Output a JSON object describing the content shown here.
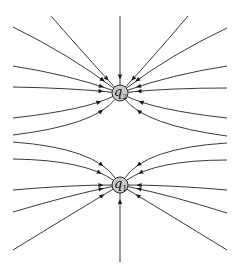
{
  "diagram": {
    "line_color": "#3a3a3a",
    "charge_fill": "#c8c8c8",
    "charges": [
      {
        "id": "q2",
        "symbol": "q",
        "subscript": "2",
        "cx": 120,
        "cy": 93,
        "r": 8
      },
      {
        "id": "q1",
        "symbol": "q",
        "subscript": "1",
        "cx": 120,
        "cy": 185,
        "r": 8
      }
    ],
    "field_direction": "inward",
    "lines_q2": [
      {
        "from": [
          120,
          16
        ],
        "ctrl": [
          120,
          50
        ],
        "arrow_t": 0.92
      },
      {
        "from": [
          51,
          16
        ],
        "ctrl": [
          85,
          55
        ],
        "arrow_t": 0.9
      },
      {
        "from": [
          188,
          16
        ],
        "ctrl": [
          155,
          55
        ],
        "arrow_t": 0.9
      },
      {
        "from": [
          13,
          27
        ],
        "ctrl": [
          70,
          55
        ],
        "arrow_t": 0.9
      },
      {
        "from": [
          227,
          28
        ],
        "ctrl": [
          170,
          55
        ],
        "arrow_t": 0.9
      },
      {
        "from": [
          13,
          66
        ],
        "ctrl": [
          70,
          75
        ],
        "arrow_t": 0.9
      },
      {
        "from": [
          227,
          66
        ],
        "ctrl": [
          170,
          75
        ],
        "arrow_t": 0.9
      },
      {
        "from": [
          13,
          87
        ],
        "ctrl": [
          70,
          88
        ],
        "arrow_t": 0.9
      },
      {
        "from": [
          227,
          88
        ],
        "ctrl": [
          170,
          88
        ],
        "arrow_t": 0.9
      },
      {
        "from": [
          13,
          118
        ],
        "ctrl": [
          85,
          110
        ],
        "arrow_t": 0.82
      },
      {
        "from": [
          227,
          118
        ],
        "ctrl": [
          155,
          110
        ],
        "arrow_t": 0.82
      },
      {
        "from": [
          13,
          135
        ],
        "ctrl": [
          95,
          125
        ],
        "arrow_t": 0.78
      },
      {
        "from": [
          227,
          136
        ],
        "ctrl": [
          145,
          125
        ],
        "arrow_t": 0.78
      }
    ],
    "lines_q1": [
      {
        "from": [
          120,
          262
        ],
        "ctrl": [
          120,
          230
        ],
        "arrow_t": 0.92
      },
      {
        "from": [
          13,
          250
        ],
        "ctrl": [
          70,
          215
        ],
        "arrow_t": 0.9
      },
      {
        "from": [
          227,
          250
        ],
        "ctrl": [
          170,
          215
        ],
        "arrow_t": 0.9
      },
      {
        "from": [
          13,
          212
        ],
        "ctrl": [
          70,
          195
        ],
        "arrow_t": 0.9
      },
      {
        "from": [
          227,
          213
        ],
        "ctrl": [
          170,
          195
        ],
        "arrow_t": 0.9
      },
      {
        "from": [
          13,
          190
        ],
        "ctrl": [
          70,
          185
        ],
        "arrow_t": 0.9
      },
      {
        "from": [
          227,
          190
        ],
        "ctrl": [
          170,
          185
        ],
        "arrow_t": 0.9
      },
      {
        "from": [
          13,
          159
        ],
        "ctrl": [
          85,
          160
        ],
        "arrow_t": 0.82
      },
      {
        "from": [
          227,
          160
        ],
        "ctrl": [
          155,
          160
        ],
        "arrow_t": 0.82
      },
      {
        "from": [
          13,
          142
        ],
        "ctrl": [
          95,
          148
        ],
        "arrow_t": 0.78
      },
      {
        "from": [
          227,
          143
        ],
        "ctrl": [
          145,
          148
        ],
        "arrow_t": 0.78
      }
    ]
  }
}
